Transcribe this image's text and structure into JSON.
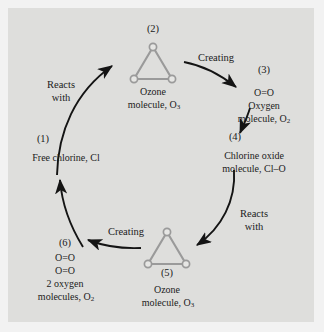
{
  "diagram": {
    "background_color": "#dededc",
    "page_color": "#f2f2f2",
    "molecule_color": "#9a9a9a",
    "arrow_color": "#141414",
    "text_color": "#1b1b1b"
  },
  "stages": [
    {
      "id": "stage-1",
      "number": "(1)",
      "line1": "Free chlorine, Cl",
      "line2": "",
      "line3": "",
      "molecule": "none"
    },
    {
      "id": "stage-2",
      "number": "(2)",
      "line1": "Ozone",
      "line2": "molecule, O",
      "sub": "3",
      "molecule": "ozone-triangle"
    },
    {
      "id": "stage-3",
      "number": "(3)",
      "line1": "O=O",
      "line2": "Oxygen",
      "line3": "molecule, O",
      "sub": "2",
      "molecule": "none"
    },
    {
      "id": "stage-4",
      "number": "(4)",
      "line1": "Chlorine oxide",
      "line2": "molecule, Cl–O",
      "line3": "",
      "molecule": "none"
    },
    {
      "id": "stage-5",
      "number": "(5)",
      "line1": "Ozone",
      "line2": "molecule, O",
      "sub": "3",
      "molecule": "ozone-triangle"
    },
    {
      "id": "stage-6",
      "number": "(6)",
      "line1": "O=O",
      "line2": "O=O",
      "line3": "2 oxygen",
      "line4": "molecules, O",
      "sub": "2",
      "molecule": "none"
    }
  ],
  "transitions": [
    {
      "id": "reacts-with-top-left",
      "line1": "Reacts",
      "line2": "with"
    },
    {
      "id": "creating-top-right",
      "line1": "Creating",
      "line2": ""
    },
    {
      "id": "reacts-with-bottom-right",
      "line1": "Reacts",
      "line2": "with"
    },
    {
      "id": "creating-bottom-left",
      "line1": "Creating",
      "line2": ""
    }
  ]
}
